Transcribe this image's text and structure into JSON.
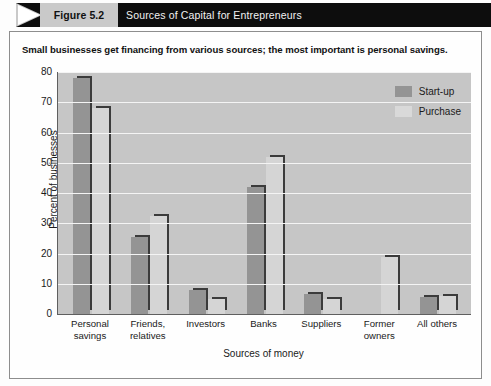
{
  "header": {
    "figure_number": "Figure 5.2",
    "title": "Sources of Capital for Entrepreneurs"
  },
  "subtitle": "Small businesses get financing from various sources; the most important is personal savings.",
  "colors": {
    "startup": "#949494",
    "purchase": "#d5d5d5",
    "plot_background": "#c6c6c6",
    "gridline": "#f4f4f4",
    "header_bar": "#0d0d0d",
    "figure_tag": "#c9c9c9"
  },
  "chart_data": {
    "type": "bar",
    "title": "Sources of Capital for Entrepreneurs",
    "subtitle": "Small businesses get financing from various sources; the most important is personal savings.",
    "xlabel": "Sources of money",
    "ylabel": "Percent of businesses",
    "ylim": [
      0,
      80
    ],
    "yticks": [
      80,
      70,
      60,
      50,
      40,
      30,
      20,
      10,
      0
    ],
    "grid": true,
    "legend_position": "top-right",
    "categories": [
      "Personal\nsavings",
      "Friends,\nrelatives",
      "Investors",
      "Banks",
      "Suppliers",
      "Former\nowners",
      "All others"
    ],
    "category_lines": [
      [
        "Personal",
        "savings"
      ],
      [
        "Friends,",
        "relatives"
      ],
      [
        "Investors",
        ""
      ],
      [
        "Banks",
        ""
      ],
      [
        "Suppliers",
        ""
      ],
      [
        "Former",
        "owners"
      ],
      [
        "All others",
        ""
      ]
    ],
    "series": [
      {
        "name": "Start-up",
        "color": "#949494",
        "values": [
          78,
          25.5,
          8,
          42,
          6.5,
          0,
          5.5
        ]
      },
      {
        "name": "Purchase",
        "color": "#d5d5d5",
        "values": [
          68,
          32.5,
          5,
          52,
          5,
          19,
          6
        ]
      }
    ]
  }
}
